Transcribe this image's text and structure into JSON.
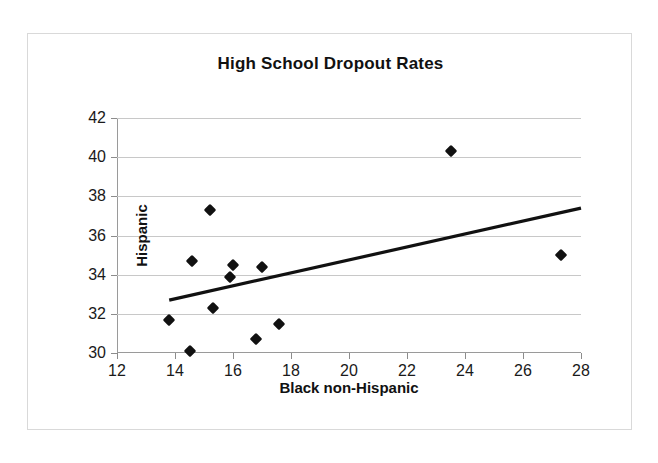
{
  "chart_data": {
    "type": "scatter",
    "title": "High School Dropout Rates",
    "xlabel": "Black non-Hispanic",
    "ylabel": "Hispanic",
    "xlim": [
      12,
      28
    ],
    "ylim": [
      30,
      42
    ],
    "xticks": [
      12,
      14,
      16,
      18,
      20,
      22,
      24,
      26,
      28
    ],
    "yticks": [
      30,
      32,
      34,
      36,
      38,
      40,
      42
    ],
    "grid": "horizontal",
    "legend": "none",
    "marker": "black-diamond",
    "series": [
      {
        "name": "States",
        "points": [
          [
            13.8,
            31.7
          ],
          [
            14.5,
            30.1
          ],
          [
            14.6,
            34.7
          ],
          [
            15.2,
            37.3
          ],
          [
            15.3,
            32.3
          ],
          [
            15.9,
            33.9
          ],
          [
            16.0,
            34.5
          ],
          [
            16.8,
            30.7
          ],
          [
            17.0,
            34.4
          ],
          [
            17.6,
            31.5
          ],
          [
            23.5,
            40.3
          ],
          [
            27.3,
            35.0
          ]
        ]
      }
    ],
    "trendline": {
      "type": "linear",
      "x_start": 13.8,
      "y_start": 32.7,
      "x_end": 28.0,
      "y_end": 37.4
    }
  },
  "figure": {
    "title": "High School Dropout Rates"
  }
}
